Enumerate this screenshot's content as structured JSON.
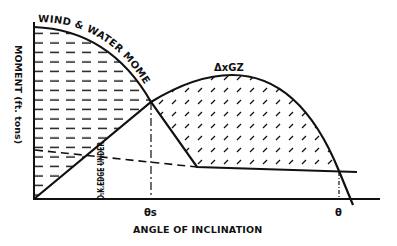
{
  "diagram": {
    "curves": {
      "wind_moment_label": "WIND & WATER MOMENT",
      "righting_moment_label": "ΔxGZ"
    },
    "axes": {
      "y_label": "MOMENT (ft. tons)",
      "x_label": "ANGLE OF INCLINATION"
    },
    "markers": {
      "theta_s": "θs",
      "theta": "θ",
      "deck_edge": "D.K.EDGE UNDER"
    },
    "colors": {
      "ink": "#111111",
      "background": "#ffffff"
    }
  }
}
